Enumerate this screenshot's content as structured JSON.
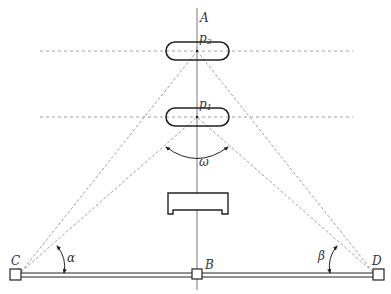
{
  "diagram": {
    "labels": {
      "axis_top": "A",
      "p2": "p",
      "p2_sub": "2",
      "p1": "p",
      "p1_sub": "1",
      "omega": "ω",
      "alpha": "α",
      "beta": "β",
      "left_station": "C",
      "center_station": "B",
      "right_station": "D"
    },
    "colors": {
      "stroke": "#222222",
      "dashed": "#888888",
      "background": "#ffffff"
    },
    "elements": {
      "vertical_axis": "A",
      "upper_target": "p2",
      "lower_target": "p1",
      "obstacle": "bracket",
      "baseline": "C-B-D"
    }
  }
}
